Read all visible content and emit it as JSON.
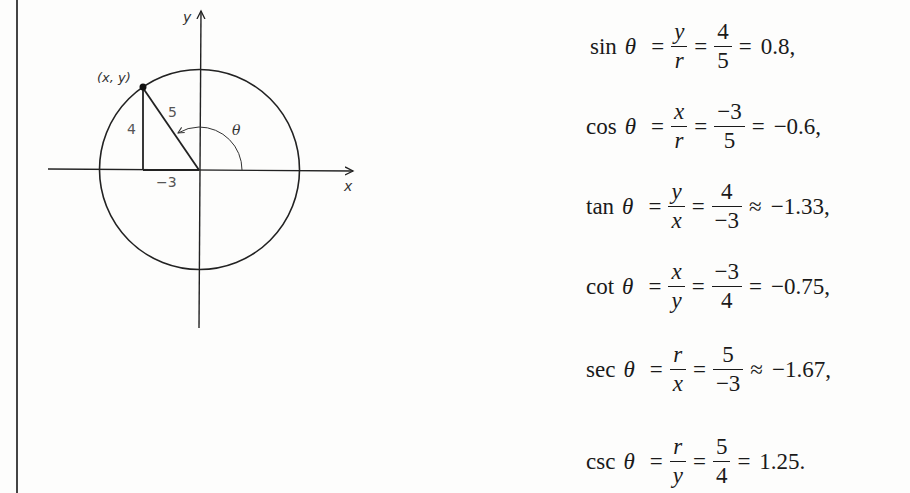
{
  "diagram": {
    "axis_labels": {
      "x": "x",
      "y": "y"
    },
    "point_label": "(x, y)",
    "side_labels": {
      "hypotenuse": "5",
      "opposite": "4",
      "adjacent": "−3"
    },
    "angle_label": "θ",
    "point": {
      "x": -3,
      "y": 4
    },
    "radius": 5
  },
  "equations": [
    {
      "fn": "sin",
      "theta": "θ",
      "eq1": "=",
      "ratio_num": "y",
      "ratio_den": "r",
      "eq2": "=",
      "frac_num": "4",
      "frac_den": "5",
      "eq3": "=",
      "result": "0.8,"
    },
    {
      "fn": "cos",
      "theta": "θ",
      "eq1": "=",
      "ratio_num": "x",
      "ratio_den": "r",
      "eq2": "=",
      "frac_num": "−3",
      "frac_den": "5",
      "eq3": "=",
      "result": "−0.6,"
    },
    {
      "fn": "tan",
      "theta": "θ",
      "eq1": "=",
      "ratio_num": "y",
      "ratio_den": "x",
      "eq2": "=",
      "frac_num": "4",
      "frac_den": "−3",
      "eq3": "≈",
      "result": "−1.33,"
    },
    {
      "fn": "cot",
      "theta": "θ",
      "eq1": "=",
      "ratio_num": "x",
      "ratio_den": "y",
      "eq2": "=",
      "frac_num": "−3",
      "frac_den": "4",
      "eq3": "=",
      "result": "−0.75,"
    },
    {
      "fn": "sec",
      "theta": "θ",
      "eq1": "=",
      "ratio_num": "r",
      "ratio_den": "x",
      "eq2": "=",
      "frac_num": "5",
      "frac_den": "−3",
      "eq3": "≈",
      "result": "−1.67,"
    },
    {
      "fn": "csc",
      "theta": "θ",
      "eq1": "=",
      "ratio_num": "r",
      "ratio_den": "y",
      "eq2": "=",
      "frac_num": "5",
      "frac_den": "4",
      "eq3": "=",
      "result": "1.25."
    }
  ]
}
